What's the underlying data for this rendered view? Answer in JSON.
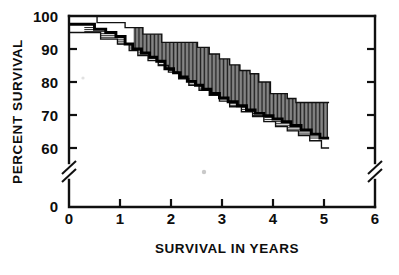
{
  "chart_data": {
    "type": "line",
    "title": "",
    "subtitle": "",
    "xlabel": "SURVIVAL IN YEARS",
    "ylabel": "PERCENT SURVIVAL",
    "xlim": [
      0,
      6
    ],
    "ylim": [
      0,
      100
    ],
    "y_axis_break": {
      "present": true,
      "between": [
        0,
        55
      ],
      "style": "double-slash"
    },
    "x_ticks": [
      0,
      1,
      2,
      3,
      4,
      5,
      6
    ],
    "x_tick_labels": [
      "0",
      "1",
      "2",
      "3",
      "4",
      "5",
      "6"
    ],
    "y_ticks": [
      0,
      60,
      70,
      80,
      90,
      100
    ],
    "y_tick_labels": [
      "0",
      "60",
      "70",
      "80",
      "90",
      "100"
    ],
    "grid": false,
    "legend": "none",
    "curve_style": "kaplan-meier step function with hatched confidence bands",
    "series": [
      {
        "name": "Survival estimate",
        "style": "thick-step",
        "x": [
          0.0,
          0.5,
          0.5,
          0.72,
          0.72,
          0.92,
          0.92,
          1.1,
          1.1,
          1.25,
          1.25,
          1.42,
          1.42,
          1.58,
          1.58,
          1.72,
          1.72,
          1.88,
          1.88,
          2.05,
          2.05,
          2.18,
          2.18,
          2.32,
          2.32,
          2.48,
          2.48,
          2.62,
          2.62,
          2.78,
          2.78,
          2.95,
          2.95,
          3.12,
          3.12,
          3.3,
          3.3,
          3.48,
          3.48,
          3.65,
          3.65,
          3.82,
          3.82,
          4.0,
          4.0,
          4.18,
          4.18,
          4.35,
          4.35,
          4.55,
          4.55,
          4.75,
          4.75,
          4.92,
          4.92,
          5.1
        ],
        "y": [
          97.5,
          97.5,
          96.0,
          96.0,
          95.0,
          95.0,
          93.8,
          93.8,
          91.5,
          91.5,
          90.0,
          90.0,
          88.8,
          88.8,
          87.5,
          87.5,
          86.3,
          86.3,
          84.0,
          84.0,
          82.8,
          82.8,
          81.5,
          81.5,
          80.2,
          80.2,
          79.0,
          79.0,
          77.8,
          77.8,
          76.5,
          76.5,
          75.2,
          75.2,
          74.0,
          74.0,
          72.8,
          72.8,
          71.5,
          71.5,
          70.5,
          70.5,
          69.8,
          69.8,
          68.8,
          68.8,
          68.0,
          68.0,
          66.8,
          66.8,
          65.5,
          65.5,
          64.2,
          64.2,
          63.0,
          63.0
        ]
      },
      {
        "name": "Upper confidence limit",
        "style": "thin-step",
        "x": [
          0.0,
          0.55,
          0.55,
          1.1,
          1.1,
          1.45,
          1.45,
          1.82,
          1.82,
          2.52,
          2.52,
          2.75,
          2.75,
          2.95,
          2.95,
          3.15,
          3.15,
          3.35,
          3.35,
          3.55,
          3.55,
          3.72,
          3.72,
          3.95,
          3.95,
          4.28,
          4.28,
          4.45,
          4.45,
          5.1
        ],
        "y": [
          100.0,
          100.0,
          98.0,
          98.0,
          96.5,
          96.5,
          94.5,
          94.5,
          92.0,
          92.0,
          90.5,
          90.5,
          88.5,
          88.5,
          87.0,
          87.0,
          85.2,
          85.2,
          83.5,
          83.5,
          82.5,
          82.5,
          80.0,
          80.0,
          76.5,
          76.5,
          75.0,
          75.0,
          73.8,
          73.8
        ]
      },
      {
        "name": "Lower confidence limit",
        "style": "thin-step",
        "x": [
          0.0,
          0.62,
          0.62,
          0.95,
          0.95,
          1.18,
          1.18,
          1.35,
          1.35,
          1.55,
          1.55,
          1.75,
          1.75,
          1.95,
          1.95,
          2.15,
          2.15,
          2.35,
          2.35,
          2.55,
          2.55,
          2.75,
          2.75,
          2.95,
          2.95,
          3.15,
          3.15,
          3.38,
          3.38,
          3.6,
          3.6,
          3.82,
          3.82,
          4.05,
          4.05,
          4.28,
          4.28,
          4.5,
          4.5,
          4.72,
          4.72,
          4.95,
          4.95,
          5.1
        ],
        "y": [
          95.0,
          95.0,
          93.0,
          93.0,
          91.5,
          91.5,
          89.5,
          89.5,
          88.0,
          88.0,
          86.5,
          86.5,
          85.0,
          85.0,
          83.0,
          83.0,
          81.0,
          81.0,
          79.0,
          79.0,
          77.5,
          77.5,
          76.0,
          76.0,
          74.2,
          74.2,
          72.5,
          72.5,
          71.0,
          71.0,
          69.5,
          69.5,
          68.0,
          68.0,
          66.5,
          66.5,
          65.2,
          65.2,
          63.8,
          63.8,
          62.2,
          62.2,
          60.0,
          60.0
        ]
      }
    ]
  },
  "axes": {
    "y_label": "PERCENT SURVIVAL",
    "x_label": "SURVIVAL IN YEARS",
    "y_tick_labels": [
      "100",
      "90",
      "80",
      "70",
      "60",
      "0"
    ],
    "x_tick_labels": [
      "0",
      "1",
      "2",
      "3",
      "4",
      "5",
      "6"
    ]
  },
  "colors": {
    "background": "#ffffff",
    "ink": "#101010",
    "hatch": "#222222"
  }
}
